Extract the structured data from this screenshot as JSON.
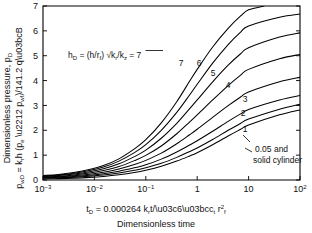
{
  "chart_data": {
    "type": "line",
    "title": "",
    "xlabel": "tD = 0.000264 krt/φμct r2f",
    "xlabel_line2": "Dimensionless time",
    "ylabel_line1": "Dimensionless pressure, pD",
    "ylabel_line2": "pwD = krh (pe − pwf)/141.2 qμB",
    "xscale": "log",
    "yscale": "linear",
    "xlim": [
      0.001,
      100
    ],
    "ylim": [
      0,
      7
    ],
    "grid": false,
    "legend_position": "inline-curve-labels",
    "xtick_labels": [
      "10-3",
      "10-2",
      "10-1",
      "1",
      "10",
      "102"
    ],
    "xtick_values": [
      0.001,
      0.01,
      0.1,
      1,
      10,
      100
    ],
    "ytick_labels": [
      "0",
      "1",
      "2",
      "3",
      "4",
      "5",
      "6",
      "7"
    ],
    "ytick_values": [
      0,
      1,
      2,
      3,
      4,
      5,
      6,
      7
    ],
    "annotation": {
      "text": "hD  =  (h/rf) √k r/k z  =  7",
      "parts": {
        "h": "h",
        "D": "D",
        "eq1": "  =  (h/r",
        "f": "f",
        "eq2": ") ",
        "radical": "√",
        "kr": "k",
        "r": "r",
        "slash": "/k",
        "z": "z",
        "eq3": "  =  7"
      }
    },
    "curve_note": {
      "line1": "0.05 and",
      "line2": "solid cylinder"
    },
    "series": [
      {
        "name": "7",
        "label": "7",
        "points": [
          [
            0.001,
            0.18
          ],
          [
            0.002,
            0.22
          ],
          [
            0.004,
            0.3
          ],
          [
            0.008,
            0.42
          ],
          [
            0.015,
            0.58
          ],
          [
            0.03,
            0.85
          ],
          [
            0.06,
            1.25
          ],
          [
            0.1,
            1.62
          ],
          [
            0.2,
            2.3
          ],
          [
            0.4,
            3.15
          ],
          [
            0.7,
            3.95
          ],
          [
            1.0,
            4.45
          ],
          [
            2.0,
            5.35
          ],
          [
            4.0,
            6.1
          ],
          [
            7.0,
            6.6
          ],
          [
            10,
            6.85
          ],
          [
            20,
            7.0
          ]
        ]
      },
      {
        "name": "6",
        "label": "6",
        "points": [
          [
            0.001,
            0.16
          ],
          [
            0.002,
            0.2
          ],
          [
            0.004,
            0.27
          ],
          [
            0.008,
            0.38
          ],
          [
            0.015,
            0.52
          ],
          [
            0.03,
            0.76
          ],
          [
            0.06,
            1.1
          ],
          [
            0.1,
            1.42
          ],
          [
            0.2,
            2.0
          ],
          [
            0.4,
            2.72
          ],
          [
            0.7,
            3.4
          ],
          [
            1.0,
            3.85
          ],
          [
            2.0,
            4.7
          ],
          [
            4.0,
            5.45
          ],
          [
            7.0,
            5.95
          ],
          [
            10,
            6.2
          ],
          [
            40,
            6.55
          ],
          [
            100,
            6.68
          ]
        ]
      },
      {
        "name": "5",
        "label": "5",
        "points": [
          [
            0.001,
            0.14
          ],
          [
            0.002,
            0.18
          ],
          [
            0.004,
            0.24
          ],
          [
            0.008,
            0.33
          ],
          [
            0.015,
            0.45
          ],
          [
            0.03,
            0.65
          ],
          [
            0.06,
            0.94
          ],
          [
            0.1,
            1.2
          ],
          [
            0.2,
            1.68
          ],
          [
            0.4,
            2.28
          ],
          [
            0.7,
            2.85
          ],
          [
            1.0,
            3.22
          ],
          [
            2.0,
            3.95
          ],
          [
            4.0,
            4.62
          ],
          [
            7.0,
            5.08
          ],
          [
            10,
            5.32
          ],
          [
            40,
            5.75
          ],
          [
            100,
            5.92
          ]
        ]
      },
      {
        "name": "4",
        "label": "4",
        "points": [
          [
            0.001,
            0.12
          ],
          [
            0.002,
            0.15
          ],
          [
            0.004,
            0.2
          ],
          [
            0.008,
            0.28
          ],
          [
            0.015,
            0.38
          ],
          [
            0.03,
            0.54
          ],
          [
            0.06,
            0.78
          ],
          [
            0.1,
            0.99
          ],
          [
            0.2,
            1.37
          ],
          [
            0.4,
            1.86
          ],
          [
            0.7,
            2.32
          ],
          [
            1.0,
            2.62
          ],
          [
            2.0,
            3.22
          ],
          [
            4.0,
            3.8
          ],
          [
            7.0,
            4.22
          ],
          [
            10,
            4.45
          ],
          [
            40,
            4.88
          ],
          [
            100,
            5.05
          ]
        ]
      },
      {
        "name": "3",
        "label": "3",
        "points": [
          [
            0.001,
            0.1
          ],
          [
            0.002,
            0.13
          ],
          [
            0.004,
            0.17
          ],
          [
            0.008,
            0.23
          ],
          [
            0.015,
            0.31
          ],
          [
            0.03,
            0.44
          ],
          [
            0.06,
            0.62
          ],
          [
            0.1,
            0.79
          ],
          [
            0.2,
            1.08
          ],
          [
            0.4,
            1.46
          ],
          [
            0.7,
            1.81
          ],
          [
            1.0,
            2.04
          ],
          [
            2.0,
            2.52
          ],
          [
            4.0,
            2.99
          ],
          [
            7.0,
            3.34
          ],
          [
            10,
            3.54
          ],
          [
            40,
            3.95
          ],
          [
            100,
            4.13
          ]
        ]
      },
      {
        "name": "2",
        "label": "2",
        "points": [
          [
            0.001,
            0.09
          ],
          [
            0.002,
            0.11
          ],
          [
            0.004,
            0.14
          ],
          [
            0.008,
            0.19
          ],
          [
            0.015,
            0.25
          ],
          [
            0.03,
            0.35
          ],
          [
            0.06,
            0.49
          ],
          [
            0.1,
            0.61
          ],
          [
            0.2,
            0.84
          ],
          [
            0.4,
            1.13
          ],
          [
            0.7,
            1.4
          ],
          [
            1.0,
            1.58
          ],
          [
            2.0,
            1.96
          ],
          [
            4.0,
            2.36
          ],
          [
            7.0,
            2.66
          ],
          [
            10,
            2.84
          ],
          [
            40,
            3.22
          ],
          [
            100,
            3.4
          ]
        ]
      },
      {
        "name": "1",
        "label": "1",
        "points": [
          [
            0.001,
            0.07
          ],
          [
            0.002,
            0.09
          ],
          [
            0.004,
            0.11
          ],
          [
            0.008,
            0.15
          ],
          [
            0.015,
            0.2
          ],
          [
            0.03,
            0.28
          ],
          [
            0.06,
            0.39
          ],
          [
            0.1,
            0.49
          ],
          [
            0.2,
            0.67
          ],
          [
            0.4,
            0.91
          ],
          [
            0.7,
            1.14
          ],
          [
            1.0,
            1.29
          ],
          [
            2.0,
            1.63
          ],
          [
            4.0,
            2.0
          ],
          [
            7.0,
            2.28
          ],
          [
            10,
            2.45
          ],
          [
            40,
            2.85
          ],
          [
            100,
            3.05
          ]
        ]
      },
      {
        "name": "0.05 and solid cylinder",
        "label": "",
        "points": [
          [
            0.001,
            0.04
          ],
          [
            0.002,
            0.055
          ],
          [
            0.004,
            0.075
          ],
          [
            0.008,
            0.105
          ],
          [
            0.015,
            0.145
          ],
          [
            0.03,
            0.21
          ],
          [
            0.06,
            0.3
          ],
          [
            0.1,
            0.39
          ],
          [
            0.2,
            0.55
          ],
          [
            0.4,
            0.76
          ],
          [
            0.7,
            0.96
          ],
          [
            1.0,
            1.1
          ],
          [
            2.0,
            1.42
          ],
          [
            4.0,
            1.77
          ],
          [
            7.0,
            2.04
          ],
          [
            10,
            2.21
          ],
          [
            40,
            2.62
          ],
          [
            100,
            2.82
          ]
        ]
      }
    ]
  }
}
